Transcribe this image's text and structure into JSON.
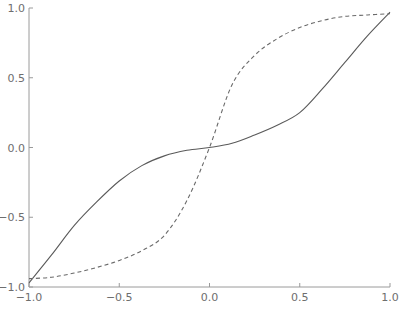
{
  "chart_data": {
    "type": "line",
    "title": "",
    "xlabel": "",
    "ylabel": "",
    "xlim": [
      -1.0,
      1.0
    ],
    "ylim": [
      -1.0,
      1.0
    ],
    "grid": false,
    "legend": null,
    "x_ticks": [
      "-1.0",
      "-0.5",
      "0.0",
      "0.5",
      "1.0"
    ],
    "y_ticks": [
      "-1.0",
      "-0.5",
      "0.0",
      "0.5",
      "1.0"
    ],
    "x": [
      -1.0,
      -0.875,
      -0.75,
      -0.625,
      -0.5,
      -0.375,
      -0.25,
      -0.125,
      0.0,
      0.125,
      0.25,
      0.375,
      0.5,
      0.625,
      0.75,
      0.875,
      1.0
    ],
    "series": [
      {
        "name": "solid",
        "style": "solid",
        "color": "#5a5a5a",
        "values": [
          -0.97,
          -0.77,
          -0.56,
          -0.39,
          -0.24,
          -0.13,
          -0.06,
          -0.02,
          0.0,
          0.03,
          0.09,
          0.16,
          0.25,
          0.42,
          0.61,
          0.8,
          0.97
        ]
      },
      {
        "name": "dashed",
        "style": "dashed",
        "color": "#6a6a6a",
        "values": [
          -0.94,
          -0.93,
          -0.9,
          -0.86,
          -0.81,
          -0.74,
          -0.63,
          -0.38,
          0.0,
          0.45,
          0.66,
          0.78,
          0.86,
          0.91,
          0.94,
          0.95,
          0.96
        ]
      }
    ]
  },
  "plot_area": {
    "left": 29,
    "right": 390,
    "top": 8,
    "bottom": 287
  }
}
